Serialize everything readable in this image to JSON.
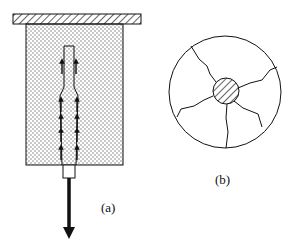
{
  "figure": {
    "panel_a": {
      "label": "(a)",
      "description": "Rod pulled out of a confined block; arrows show forces along the rod interface",
      "pull_direction": "down"
    },
    "panel_b": {
      "label": "(b)",
      "description": "Cross-section: hatched rod at center with radial cracks through surrounding circle"
    }
  },
  "colors": {
    "stroke": "#111111",
    "stipple": "#8a8a8a",
    "background": "#ffffff"
  }
}
